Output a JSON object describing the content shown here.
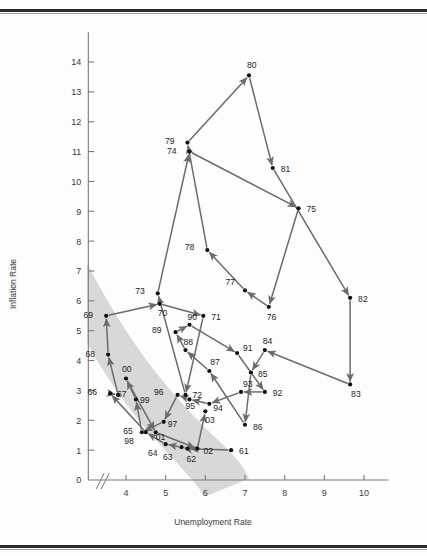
{
  "figure": {
    "background_color": "#fdfdfd",
    "line_color": "#6b6b6b",
    "point_color": "#111111",
    "band_color": "#cdcdcd",
    "axis_color": "#7a7a7a",
    "top_border_color": "#2c2c2c",
    "bottom_border_color": "#2c2c2c",
    "axis_break_marker": "//"
  },
  "chart_data": {
    "type": "scatter",
    "title": "",
    "subtitle": "",
    "xlabel": "Unemployment Rate",
    "ylabel": "Inflation Rate",
    "xlim": [
      3.0,
      10.6
    ],
    "ylim": [
      0,
      15.0
    ],
    "xticks": [
      4,
      5,
      6,
      7,
      8,
      9,
      10
    ],
    "xtick_labels": [
      "4",
      "5",
      "6",
      "7",
      "8",
      "9",
      "10"
    ],
    "yticks": [
      0,
      1,
      2,
      3,
      4,
      5,
      6,
      7,
      8,
      9,
      10,
      11,
      12,
      13,
      14
    ],
    "ytick_labels": [
      "0",
      "1",
      "2",
      "3",
      "4",
      "5",
      "6",
      "7",
      "8",
      "9",
      "10",
      "11",
      "12",
      "13",
      "14"
    ],
    "grid": false,
    "legend": null,
    "axis_break": true,
    "connected": true,
    "connection_style": "arrows-chronological",
    "annotation_note": "Shaded band indicates the downward-sloping Phillips-curve region",
    "series": [
      {
        "name": "Year",
        "points": [
          {
            "label": "61",
            "x": 6.65,
            "y": 1.0
          },
          {
            "label": "62",
            "x": 5.55,
            "y": 1.05
          },
          {
            "label": "63",
            "x": 5.4,
            "y": 1.1
          },
          {
            "label": "64",
            "x": 5.0,
            "y": 1.2
          },
          {
            "label": "65",
            "x": 4.5,
            "y": 1.6
          },
          {
            "label": "66",
            "x": 3.6,
            "y": 2.9
          },
          {
            "label": "67",
            "x": 3.8,
            "y": 2.85
          },
          {
            "label": "68",
            "x": 3.55,
            "y": 4.2
          },
          {
            "label": "69",
            "x": 3.5,
            "y": 5.5
          },
          {
            "label": "70",
            "x": 4.85,
            "y": 5.9
          },
          {
            "label": "71",
            "x": 5.95,
            "y": 5.5
          },
          {
            "label": "72",
            "x": 5.5,
            "y": 2.85
          },
          {
            "label": "73",
            "x": 4.8,
            "y": 6.25
          },
          {
            "label": "74",
            "x": 5.6,
            "y": 11.0
          },
          {
            "label": "75",
            "x": 8.35,
            "y": 9.1
          },
          {
            "label": "76",
            "x": 7.6,
            "y": 5.8
          },
          {
            "label": "77",
            "x": 7.0,
            "y": 6.35
          },
          {
            "label": "78",
            "x": 6.05,
            "y": 7.7
          },
          {
            "label": "79",
            "x": 5.55,
            "y": 11.3
          },
          {
            "label": "80",
            "x": 7.1,
            "y": 13.55
          },
          {
            "label": "81",
            "x": 7.7,
            "y": 10.45
          },
          {
            "label": "82",
            "x": 9.65,
            "y": 6.1
          },
          {
            "label": "83",
            "x": 9.65,
            "y": 3.2
          },
          {
            "label": "84",
            "x": 7.5,
            "y": 4.35
          },
          {
            "label": "85",
            "x": 7.15,
            "y": 3.6
          },
          {
            "label": "86",
            "x": 7.0,
            "y": 1.85
          },
          {
            "label": "87",
            "x": 6.1,
            "y": 3.65
          },
          {
            "label": "88",
            "x": 5.5,
            "y": 4.35
          },
          {
            "label": "89",
            "x": 5.25,
            "y": 4.95
          },
          {
            "label": "90",
            "x": 5.6,
            "y": 5.2
          },
          {
            "label": "91",
            "x": 6.8,
            "y": 4.25
          },
          {
            "label": "92",
            "x": 7.5,
            "y": 2.95
          },
          {
            "label": "93",
            "x": 6.9,
            "y": 2.95
          },
          {
            "label": "94",
            "x": 6.1,
            "y": 2.55
          },
          {
            "label": "95",
            "x": 5.6,
            "y": 2.7
          },
          {
            "label": "96",
            "x": 5.3,
            "y": 2.85
          },
          {
            "label": "97",
            "x": 4.95,
            "y": 1.95
          },
          {
            "label": "98",
            "x": 4.4,
            "y": 1.6
          },
          {
            "label": "99",
            "x": 4.25,
            "y": 2.7
          },
          {
            "label": "00",
            "x": 4.0,
            "y": 3.4
          },
          {
            "label": "01",
            "x": 4.75,
            "y": 1.6
          },
          {
            "label": "02",
            "x": 5.8,
            "y": 1.05
          },
          {
            "label": "03",
            "x": 6.0,
            "y": 2.3
          }
        ]
      }
    ]
  }
}
